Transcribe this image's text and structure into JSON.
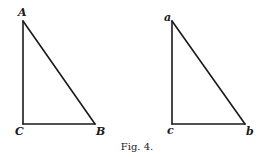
{
  "figure": {
    "caption": "Fig. 4.",
    "triangles": [
      {
        "id": "upper-case",
        "vertices": {
          "A": {
            "label": "A",
            "x": 23,
            "y": 21,
            "label_x": 18,
            "label_y": 16
          },
          "C": {
            "label": "C",
            "x": 23,
            "y": 124,
            "label_x": 15,
            "label_y": 135
          },
          "B": {
            "label": "B",
            "x": 95,
            "y": 124,
            "label_x": 96,
            "label_y": 135
          }
        },
        "right_angle_at": "C"
      },
      {
        "id": "lower-case",
        "vertices": {
          "a": {
            "label": "a",
            "x": 172,
            "y": 21,
            "label_x": 164,
            "label_y": 21
          },
          "c": {
            "label": "c",
            "x": 172,
            "y": 124,
            "label_x": 167,
            "label_y": 134
          },
          "b": {
            "label": "b",
            "x": 245,
            "y": 124,
            "label_x": 246,
            "label_y": 135
          }
        },
        "right_angle_at": "c"
      }
    ]
  }
}
